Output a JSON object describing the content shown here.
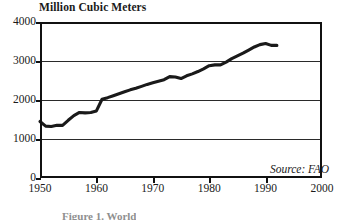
{
  "chart_data": {
    "type": "line",
    "title": "Million Cubic Meters",
    "xlabel": "",
    "ylabel": "Million Cubic Meters",
    "xlim": [
      1950,
      2000
    ],
    "ylim": [
      0,
      4000
    ],
    "grid": true,
    "legend": null,
    "annotations": [
      {
        "name": "source",
        "text": "Source: FAO",
        "position": "bottom-right-inside"
      }
    ],
    "xticks": [
      "1950",
      "1960",
      "1970",
      "1980",
      "1990",
      "2000"
    ],
    "xtick_values": [
      1950,
      1960,
      1970,
      1980,
      1990,
      2000
    ],
    "yticks": [
      "0",
      "1000",
      "2000",
      "3000",
      "4000"
    ],
    "ytick_values": [
      0,
      1000,
      2000,
      3000,
      4000
    ],
    "series": [
      {
        "name": "World Roundwood Production",
        "x": [
          1950,
          1951,
          1952,
          1953,
          1954,
          1955,
          1956,
          1957,
          1958,
          1959,
          1960,
          1961,
          1962,
          1963,
          1964,
          1965,
          1966,
          1967,
          1968,
          1969,
          1970,
          1971,
          1972,
          1973,
          1974,
          1975,
          1976,
          1977,
          1978,
          1979,
          1980,
          1981,
          1982,
          1983,
          1984,
          1985,
          1986,
          1987,
          1988,
          1989,
          1990,
          1991,
          1992
        ],
        "values": [
          1450,
          1330,
          1320,
          1350,
          1350,
          1480,
          1600,
          1680,
          1670,
          1680,
          1720,
          2020,
          2060,
          2110,
          2160,
          2210,
          2260,
          2300,
          2350,
          2400,
          2440,
          2480,
          2520,
          2600,
          2590,
          2550,
          2620,
          2670,
          2730,
          2800,
          2880,
          2900,
          2900,
          2970,
          3060,
          3130,
          3200,
          3280,
          3360,
          3420,
          3450,
          3400,
          3400
        ]
      }
    ]
  },
  "axes": {
    "y_ticks": [
      {
        "label": "4000",
        "value": 4000
      },
      {
        "label": "3000",
        "value": 3000
      },
      {
        "label": "2000",
        "value": 2000
      },
      {
        "label": "1000",
        "value": 1000
      },
      {
        "label": "0",
        "value": 0
      }
    ],
    "x_ticks": [
      {
        "label": "1950",
        "value": 1950
      },
      {
        "label": "1960",
        "value": 1960
      },
      {
        "label": "1970",
        "value": 1970
      },
      {
        "label": "1980",
        "value": 1980
      },
      {
        "label": "1990",
        "value": 1990
      },
      {
        "label": "2000",
        "value": 2000
      }
    ]
  },
  "title": {
    "text": "Million Cubic Meters"
  },
  "source": {
    "text": "Source: FAO"
  },
  "caption": {
    "text": "Figure 1. World"
  },
  "colors": {
    "line": "#1a1a1a",
    "frame": "#111111",
    "grid": "#2a2a2a",
    "background": "#ffffff"
  }
}
